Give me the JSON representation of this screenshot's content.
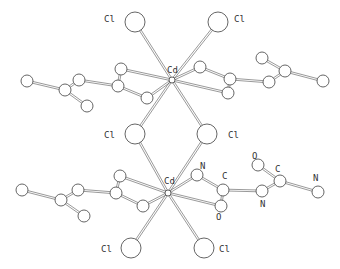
{
  "colors": {
    "line": "#555555",
    "atom_fill": "#ffffff",
    "background": "#ffffff"
  },
  "labels": {
    "cd_top": "Cd",
    "cd_bottom": "Cd",
    "cl_top_left": "Cl",
    "cl_top_right": "Cl",
    "cl_bridge_left": "Cl",
    "cl_bridge_right": "Cl",
    "cl_bottom_left": "Cl",
    "cl_bottom_right": "Cl",
    "n1": "N",
    "c1": "C",
    "o1": "O",
    "n2": "N",
    "o2": "O",
    "c2": "C",
    "n3": "N"
  },
  "atoms": [
    {
      "id": "cd1",
      "el": "Cd",
      "label": "cd_top"
    },
    {
      "id": "cd2",
      "el": "Cd",
      "label": "cd_bottom"
    },
    {
      "id": "cl1",
      "el": "Cl",
      "label": "cl_top_left"
    },
    {
      "id": "cl2",
      "el": "Cl",
      "label": "cl_top_right"
    },
    {
      "id": "cl3",
      "el": "Cl",
      "label": "cl_bridge_left"
    },
    {
      "id": "cl4",
      "el": "Cl",
      "label": "cl_bridge_right"
    },
    {
      "id": "cl5",
      "el": "Cl",
      "label": "cl_bottom_left"
    },
    {
      "id": "cl6",
      "el": "Cl",
      "label": "cl_bottom_right"
    },
    {
      "id": "bn1",
      "el": "N",
      "label": "n1"
    },
    {
      "id": "bc1",
      "el": "C",
      "label": "c1"
    },
    {
      "id": "bo1",
      "el": "O",
      "label": "o1"
    },
    {
      "id": "bn2",
      "el": "N",
      "label": "n2"
    },
    {
      "id": "bo2",
      "el": "O",
      "label": "o2"
    },
    {
      "id": "bc2",
      "el": "C",
      "label": "c2"
    },
    {
      "id": "bn3",
      "el": "N",
      "label": "n3"
    }
  ]
}
